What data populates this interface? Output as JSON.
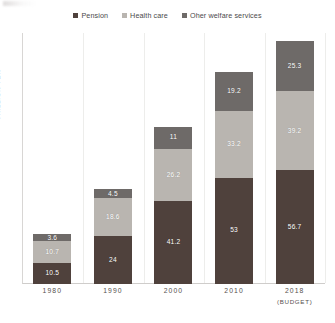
{
  "chart_data": {
    "type": "bar",
    "subtype": "stacked-bar",
    "title": "",
    "xlabel": "",
    "ylabel": "TRILLION YEN",
    "categories": [
      "1980",
      "1990",
      "2000",
      "2010",
      "2018"
    ],
    "category_sublabels": [
      "",
      "",
      "",
      "",
      "(BUDGET)"
    ],
    "ylim": [
      0,
      125
    ],
    "grid": "vertical-only",
    "y_tick_labels": [],
    "legend_position": "top-center",
    "stack_order_bottom_to_top": [
      "Pension",
      "Health care",
      "Oher welfare services"
    ],
    "series": [
      {
        "name": "Pension",
        "color": "#4f413c",
        "values": [
          10.5,
          24,
          41.2,
          53,
          56.7
        ],
        "labels": [
          "10.5",
          "24",
          "41.2",
          "53",
          "56.7"
        ]
      },
      {
        "name": "Health care",
        "color": "#b9b5b0",
        "values": [
          10.7,
          18.6,
          26.2,
          33.2,
          39.2
        ],
        "labels": [
          "10.7",
          "18.6",
          "26.2",
          "33.2",
          "39.2"
        ]
      },
      {
        "name": "Oher welfare services",
        "color": "#6e6a68",
        "values": [
          3.6,
          4.5,
          11,
          19.2,
          25.3
        ],
        "labels": [
          "3.6",
          "4.5",
          "11",
          "19.2",
          "25.3"
        ]
      }
    ],
    "totals": [
      24.8,
      47.1,
      78.4,
      105.4,
      121.2
    ]
  },
  "legend": {
    "items": [
      {
        "label": "Pension",
        "color": "#4f413c"
      },
      {
        "label": "Health care",
        "color": "#b9b5b0"
      },
      {
        "label": "Oher welfare services",
        "color": "#6e6a68"
      }
    ]
  },
  "axis": {
    "y_title": "TRILLION YEN"
  }
}
